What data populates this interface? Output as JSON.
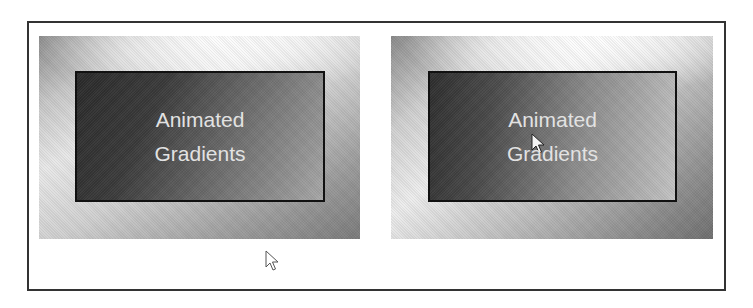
{
  "panels": [
    {
      "id": "frame-1",
      "lines": [
        "Animated",
        "Gradients"
      ]
    },
    {
      "id": "frame-2",
      "lines": [
        "Animated",
        "Gradients"
      ]
    }
  ],
  "cursors": [
    {
      "name": "pointer-outline-icon",
      "style": "outline"
    },
    {
      "name": "pointer-arrow-icon",
      "style": "filled-white"
    }
  ],
  "colors": {
    "frame_border": "#333333",
    "inner_border": "#111111",
    "text": "#e2e2e2",
    "background": "#ffffff"
  }
}
